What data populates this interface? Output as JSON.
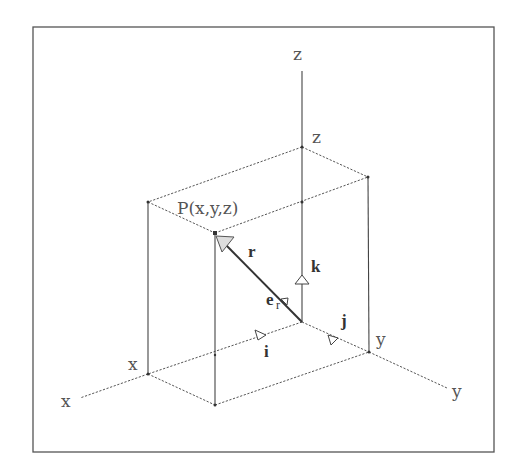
{
  "diagram": {
    "point_label": "P(x,y,z)",
    "axes": {
      "x_label": "x",
      "y_label": "y",
      "z_label": "z"
    },
    "box_labels": {
      "x_intercept": "x",
      "y_intercept": "y",
      "z_intercept": "z"
    },
    "vectors": {
      "position": "r",
      "unit_radial": "e",
      "unit_radial_sub": "r",
      "unit_i": "i",
      "unit_j": "j",
      "unit_k": "k"
    },
    "colors": {
      "line": "#444444",
      "background": "#ffffff"
    }
  }
}
